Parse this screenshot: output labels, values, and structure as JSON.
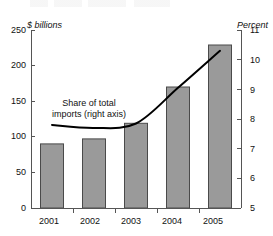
{
  "chart_data": {
    "type": "bar",
    "title": "",
    "categories": [
      "2001",
      "2002",
      "2003",
      "2004",
      "2005"
    ],
    "xlabel": "",
    "ylabel": "$ billions",
    "ylim": [
      0,
      250
    ],
    "yticks": [
      0,
      50,
      100,
      150,
      200,
      250
    ],
    "y2label": "Percent",
    "y2lim": [
      5,
      11
    ],
    "y2ticks": [
      5,
      6,
      7,
      8,
      9,
      10,
      11
    ],
    "grid": false,
    "legend_position": "inline-annotation",
    "series": [
      {
        "name": "Imports",
        "type": "bar",
        "axis": "left",
        "units": "$ billions",
        "color": "#9a9a9a",
        "edge_color": "#4a4a4a",
        "values": [
          90,
          97,
          119,
          170,
          229
        ]
      },
      {
        "name": "Share of total imports (right axis)",
        "type": "line",
        "axis": "right",
        "units": "Percent",
        "color": "#000000",
        "values": [
          7.8,
          7.7,
          7.85,
          9.05,
          10.3
        ]
      }
    ],
    "annotations": [
      {
        "name": "share-of-total-imports",
        "line1": "Share of total",
        "line2": "imports (right axis)"
      }
    ]
  },
  "axis": {
    "left_title": "$ billions",
    "right_title": "Percent",
    "left_ticks": [
      "250",
      "200",
      "150",
      "100",
      "50",
      "0"
    ],
    "right_ticks": [
      "11",
      "10",
      "9",
      "8",
      "7",
      "6",
      "5"
    ],
    "x_ticks": [
      "2001",
      "2002",
      "2003",
      "2004",
      "2005"
    ]
  },
  "annotation": {
    "line1": "Share of total",
    "line2": "imports (right axis)"
  }
}
